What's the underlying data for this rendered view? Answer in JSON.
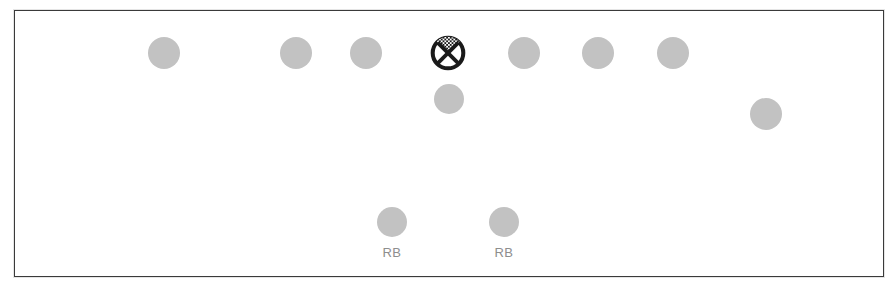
{
  "diagram": {
    "background_color": "#ffffff",
    "frame": {
      "border_color": "#3a3a3a",
      "x": 14,
      "y": 10,
      "width": 870,
      "height": 267
    },
    "player_fill_color": "#c2c2c2",
    "label_color": "#8e8e8e",
    "center_symbol_color": "#1a1a1a"
  },
  "players": [
    {
      "id": "p1",
      "label": "",
      "x": 163,
      "y": 52,
      "r": 16,
      "type": "circle"
    },
    {
      "id": "p2",
      "label": "",
      "x": 295,
      "y": 52,
      "r": 16,
      "type": "circle"
    },
    {
      "id": "p3",
      "label": "",
      "x": 365,
      "y": 52,
      "r": 16,
      "type": "circle"
    },
    {
      "id": "p4",
      "label": "",
      "x": 447,
      "y": 52,
      "r": 18,
      "type": "center-x"
    },
    {
      "id": "p5",
      "label": "",
      "x": 523,
      "y": 52,
      "r": 16,
      "type": "circle"
    },
    {
      "id": "p6",
      "label": "",
      "x": 597,
      "y": 52,
      "r": 16,
      "type": "circle"
    },
    {
      "id": "p7",
      "label": "",
      "x": 672,
      "y": 52,
      "r": 16,
      "type": "circle"
    },
    {
      "id": "p8",
      "label": "",
      "x": 448,
      "y": 98,
      "r": 15,
      "type": "circle"
    },
    {
      "id": "p9",
      "label": "",
      "x": 765,
      "y": 113,
      "r": 16,
      "type": "circle"
    },
    {
      "id": "p10",
      "label": "RB",
      "x": 391,
      "y": 221,
      "r": 15,
      "type": "circle"
    },
    {
      "id": "p11",
      "label": "RB",
      "x": 503,
      "y": 221,
      "r": 15,
      "type": "circle"
    }
  ]
}
